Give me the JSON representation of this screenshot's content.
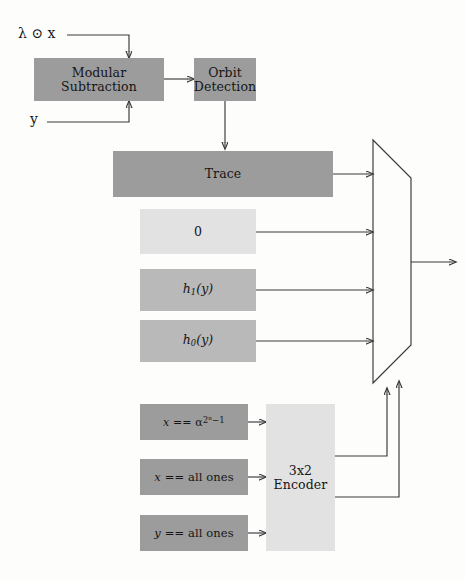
{
  "figure": {
    "type": "block-diagram"
  },
  "inputs": [
    {
      "name": "lambda-dot-x",
      "label": "λ ⊙ x"
    },
    {
      "name": "y",
      "label": "y"
    }
  ],
  "blocks": {
    "modular_subtraction": {
      "line1": "Modular",
      "line2": "Subtraction",
      "fill": "#9c9c9c"
    },
    "orbit_detection": {
      "line1": "Orbit",
      "line2": "Detection",
      "fill": "#9c9c9c"
    },
    "trace": {
      "label": "Trace",
      "fill": "#9c9c9c"
    },
    "zero": {
      "label": "0",
      "fill": "#e2e2e2"
    },
    "h1": {
      "label": "h₁(y)",
      "fill": "#b9b9b9"
    },
    "h0": {
      "label": "h₀(y)",
      "fill": "#b9b9b9"
    },
    "cmp_alpha": {
      "label": "x == α^(2ⁿ−1)",
      "fill": "#9c9c9c"
    },
    "cmp_x_all_ones": {
      "label": "x == all ones",
      "fill": "#9c9c9c"
    },
    "cmp_y_all_ones": {
      "label": "y == all ones",
      "fill": "#9c9c9c"
    },
    "encoder": {
      "line1": "3x2",
      "line2": "Encoder",
      "fill": "#e2e2e2"
    },
    "mux": {
      "label": "",
      "fill": "#ffffff"
    }
  },
  "colors": {
    "dark_gray": "#9c9c9c",
    "mid_gray": "#b9b9b9",
    "light_gray": "#e2e2e2",
    "stroke": "#3a3a3a",
    "background": "#fdfdfc"
  },
  "mux_data_inputs": [
    "trace",
    "zero",
    "h1",
    "h0"
  ],
  "mux_select_inputs": [
    "encoder-bit-1",
    "encoder-bit-0"
  ],
  "mux_output": {
    "name": "mux-output",
    "label": ""
  }
}
